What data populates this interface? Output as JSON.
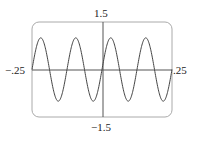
{
  "chart_data": {
    "type": "line",
    "title": "",
    "xlabel": "",
    "ylabel": "",
    "xlim": [
      -0.25,
      0.25
    ],
    "ylim": [
      -1.5,
      1.5
    ],
    "tick_labels": {
      "x_min": "−.25",
      "x_max": ".25",
      "y_max": "1.5",
      "y_min": "−1.5"
    },
    "series": [
      {
        "name": "y = sin(16πx)",
        "function": "sin(2*pi*8*x)",
        "amplitude": 1,
        "period": 0.125,
        "x": [
          -0.25,
          -0.21875,
          -0.1875,
          -0.15625,
          -0.125,
          -0.09375,
          -0.0625,
          -0.03125,
          0,
          0.03125,
          0.0625,
          0.09375,
          0.125,
          0.15625,
          0.1875,
          0.21875,
          0.25
        ],
        "values": [
          0,
          1,
          0,
          -1,
          0,
          1,
          0,
          -1,
          0,
          1,
          0,
          -1,
          0,
          1,
          0,
          -1,
          0
        ]
      }
    ],
    "grid": false,
    "legend": null,
    "frame": "rounded viewing window"
  }
}
